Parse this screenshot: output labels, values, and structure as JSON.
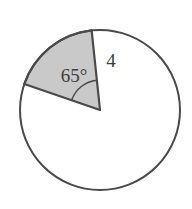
{
  "figure": {
    "background_color": "#ffffff",
    "stroke_color": "#4a4a4a",
    "sector_fill_color": "#c9c9c9",
    "label_color": "#3d3d3d",
    "circle": {
      "center_x": 100,
      "center_y": 110,
      "radius_px": 80,
      "stroke_width": 2
    },
    "sector": {
      "central_angle_label": "65°",
      "central_angle_value": 65,
      "radius_label": "4",
      "radius_value": 4,
      "start_angle_deg": 96,
      "end_angle_deg": 161,
      "arc_marker_radius_px": 30
    },
    "labels": {
      "angle": {
        "text": "65°",
        "x": 74,
        "y": 82
      },
      "radius": {
        "text": "4",
        "x": 111,
        "y": 67
      }
    }
  }
}
